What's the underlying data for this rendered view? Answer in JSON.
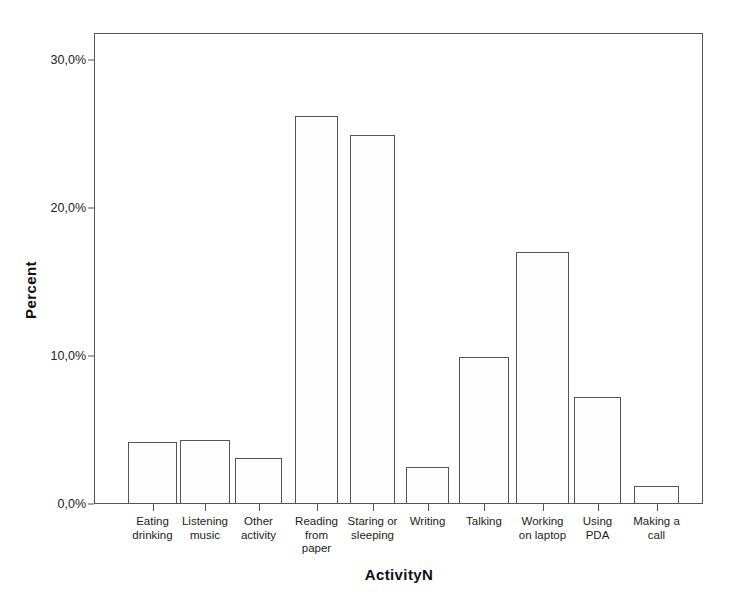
{
  "chart_data": {
    "type": "bar",
    "title": "",
    "xlabel": "ActivityN",
    "ylabel": "Percent",
    "categories": [
      "Eating\ndrinking",
      "Listening\nmusic",
      "Other\nactivity",
      "Reading\nfrom\npaper",
      "Staring or\nsleeping",
      "Writing",
      "Talking",
      "Working\non laptop",
      "Using\nPDA",
      "Making a\ncall"
    ],
    "values": [
      4.2,
      4.3,
      3.1,
      26.2,
      24.9,
      2.5,
      9.9,
      17.0,
      7.2,
      1.2
    ],
    "ylim": [
      0,
      32
    ],
    "ytick_values": [
      0,
      10,
      20,
      30
    ],
    "ytick_labels": [
      "0,0%",
      "10,0%",
      "20,0%",
      "30,0%"
    ],
    "grid": false,
    "legend": false,
    "bar_fill_color": "#fdfdfd",
    "bar_edge_color": "#555555",
    "axis_color": "#555555",
    "background_color": "#ffffff"
  },
  "axes": {
    "y_title": "Percent",
    "x_title": "ActivityN"
  }
}
